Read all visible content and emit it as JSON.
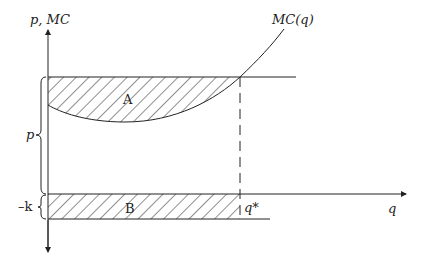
{
  "diagram": {
    "y_axis_label": "p, MC",
    "x_axis_label": "q",
    "curve_label": "MC(q)",
    "region_a_label": "A",
    "region_b_label": "B",
    "price_brace_label": "p",
    "k_brace_label": "–k",
    "q_star_label": "q*",
    "colors": {
      "ink": "#222222",
      "background": "#ffffff"
    }
  }
}
